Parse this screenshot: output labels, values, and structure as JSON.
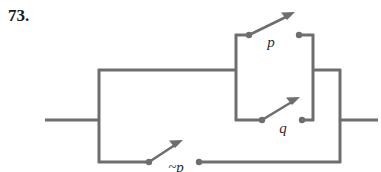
{
  "figure": {
    "problem_number": "73.",
    "type": "switching-circuit-diagram",
    "line_color": "#6e6e6e",
    "label_color": "#2b2b2b",
    "background_color": "#ffffff"
  },
  "switches": [
    {
      "id": "p",
      "label": "p",
      "position": "upper-parallel-branch",
      "state": "open",
      "left_terminal": [
        249,
        35
      ],
      "right_terminal": [
        299,
        35
      ],
      "arrow_tip": [
        292,
        13
      ]
    },
    {
      "id": "q",
      "label": "q",
      "position": "lower-parallel-branch",
      "state": "open",
      "left_terminal": [
        262,
        120
      ],
      "right_terminal": [
        302,
        120
      ],
      "arrow_tip": [
        297,
        98
      ]
    },
    {
      "id": "not-p",
      "label": "~p",
      "position": "bottom-branch",
      "state": "open",
      "left_terminal": [
        149,
        162
      ],
      "right_terminal": [
        199,
        162
      ],
      "arrow_tip": [
        180,
        140
      ]
    }
  ],
  "wires": {
    "left_lead": {
      "from": [
        45,
        120
      ],
      "to": [
        99,
        120
      ]
    },
    "right_lead": {
      "from": [
        340,
        120
      ],
      "to": [
        378,
        120
      ]
    },
    "left_node_x": 99,
    "right_node_x": 340,
    "main_y": 120,
    "upper_branch_y": 70,
    "bottom_branch_y": 162,
    "inner_block_left_x": 236,
    "inner_block_right_x": 313,
    "p_row_y": 35,
    "q_row_y": 120
  }
}
